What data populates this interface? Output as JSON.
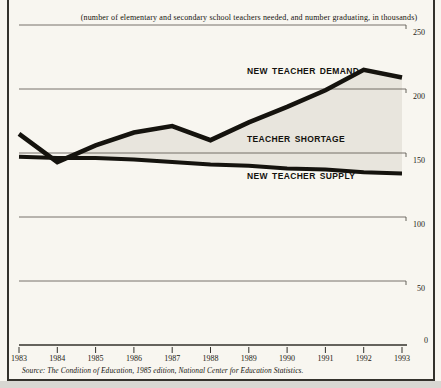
{
  "subtitle": "(number of elementary and secondary school teachers needed, and number graduating, in thousands)",
  "source": "Source: The Condition of Education, 1985 edition, National Center for Education Statistics.",
  "colors": {
    "paper": "#f8f6f0",
    "ink": "#15130e",
    "shortage_fill": "#e8e5dd",
    "gridline": "#55524a",
    "frame": "#34322c"
  },
  "chart_data": {
    "type": "line",
    "title": "",
    "subtitle": "(number of elementary and secondary school teachers needed, and number graduating, in thousands)",
    "x": [
      1983,
      1984,
      1985,
      1986,
      1987,
      1988,
      1989,
      1990,
      1991,
      1992,
      1993
    ],
    "series": [
      {
        "name": "NEW TEACHER DEMAND",
        "values": [
          165,
          143,
          156,
          166,
          171,
          160,
          174,
          186,
          199,
          215,
          209
        ]
      },
      {
        "name": "NEW TEACHER SUPPLY",
        "values": [
          147,
          146,
          146,
          145,
          143,
          141,
          140,
          138,
          137,
          135,
          134
        ]
      }
    ],
    "area_between_label": "TEACHER SHORTAGE",
    "area_between_note": "shaded region between demand and supply lines",
    "ylim": [
      0,
      250
    ],
    "yticks": [
      250,
      200,
      150,
      100,
      50,
      0
    ],
    "grid": "horizontal",
    "legend": "inline-labels",
    "units": "thousands"
  }
}
